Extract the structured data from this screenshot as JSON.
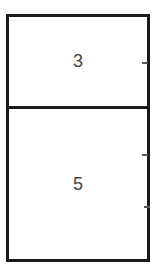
{
  "diagram": {
    "cells": [
      {
        "label": "3"
      },
      {
        "label": "5"
      }
    ],
    "colors": {
      "border": "#1a1a1a",
      "text": "#444444"
    }
  }
}
